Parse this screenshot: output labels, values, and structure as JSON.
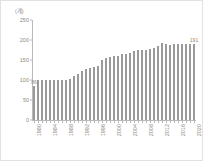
{
  "chart_data": {
    "type": "bar",
    "title": "",
    "subtitle": "",
    "xlabel": "",
    "ylabel": "(개)",
    "unit_label": "(개)",
    "ylim": [
      0,
      250
    ],
    "yticks": [
      0,
      50,
      100,
      150,
      200,
      250
    ],
    "ytick_labels": [
      "0",
      "50",
      "100",
      "150",
      "200",
      "250"
    ],
    "grid": false,
    "legend": null,
    "bar_color": "#9a9a9a",
    "axis_color": "#b9b9b9",
    "text_color": "#8a8a8a",
    "xtick_labels": [
      "1980",
      "1984",
      "1988",
      "1992",
      "1996",
      "2000",
      "2004",
      "2008",
      "2012",
      "2016",
      "2020"
    ],
    "xtick_every": 4,
    "categories": [
      "1980",
      "1981",
      "1982",
      "1983",
      "1984",
      "1985",
      "1986",
      "1987",
      "1988",
      "1989",
      "1990",
      "1991",
      "1992",
      "1993",
      "1994",
      "1995",
      "1996",
      "1997",
      "1998",
      "1999",
      "2000",
      "2001",
      "2002",
      "2003",
      "2004",
      "2005",
      "2006",
      "2007",
      "2008",
      "2009",
      "2010",
      "2011",
      "2012",
      "2013",
      "2014",
      "2015",
      "2016",
      "2017",
      "2018",
      "2019",
      "2020"
    ],
    "values": [
      86,
      99,
      99,
      99,
      99,
      100,
      100,
      101,
      101,
      103,
      110,
      116,
      122,
      128,
      131,
      132,
      134,
      150,
      154,
      157,
      159,
      160,
      164,
      165,
      168,
      172,
      176,
      176,
      174,
      178,
      180,
      185,
      192,
      191,
      188,
      189,
      189,
      189,
      190,
      190,
      191
    ],
    "annotations": [
      {
        "index": 0,
        "label": "86",
        "value": 86
      },
      {
        "index": 40,
        "label": "191",
        "value": 191
      }
    ]
  }
}
